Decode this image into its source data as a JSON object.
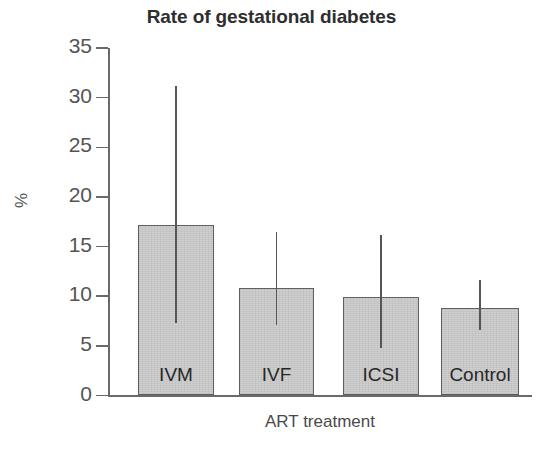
{
  "chart_data": {
    "type": "bar",
    "title": "Rate of gestational diabetes",
    "xlabel": "ART treatment",
    "ylabel": "%",
    "categories": [
      "IVM",
      "IVF",
      "ICSI",
      "Control"
    ],
    "values": [
      17.2,
      10.8,
      9.9,
      8.8
    ],
    "errors_low": [
      7.3,
      7.1,
      4.8,
      6.6
    ],
    "errors_high": [
      31.2,
      16.5,
      16.2,
      11.6
    ],
    "ylim": [
      0,
      35
    ],
    "yticks": [
      0,
      5,
      10,
      15,
      20,
      25,
      30,
      35
    ],
    "ytick_labels": [
      "0",
      "5",
      "10",
      "15",
      "20",
      "25",
      "30",
      "35"
    ],
    "grid": false,
    "legend": "none",
    "bar_fill_color": "#cccccc",
    "bar_edge_color": "#5f5f5f",
    "error_bar_color": "#555555",
    "axis_color": "#6a6a6a",
    "text_color": "#2e2e2e",
    "background_color": "#ffffff"
  },
  "caption_fragment": ""
}
